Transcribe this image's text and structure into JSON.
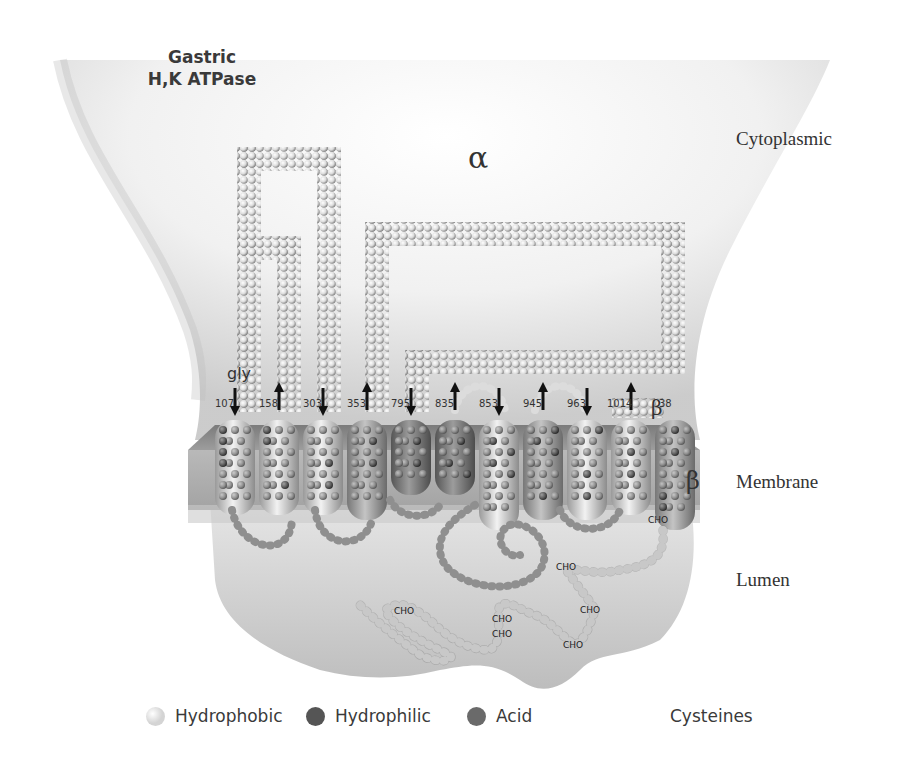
{
  "title": {
    "line1": "Gastric",
    "line2": "H,K ATPase"
  },
  "regions": {
    "cytoplasmic": "Cytoplasmic",
    "membrane": "Membrane",
    "lumen": "Lumen"
  },
  "subunits": {
    "alpha": "α",
    "beta_top": "β",
    "beta_side": "β"
  },
  "gly_label": "gly",
  "segments": [
    {
      "num": "107",
      "arrow": "down",
      "shade": "light"
    },
    {
      "num": "158",
      "arrow": "up",
      "shade": "light"
    },
    {
      "num": "303",
      "arrow": "down",
      "shade": "light"
    },
    {
      "num": "353",
      "arrow": "up",
      "shade": "medium"
    },
    {
      "num": "795",
      "arrow": "down",
      "shade": "dark"
    },
    {
      "num": "835",
      "arrow": "up",
      "shade": "dark"
    },
    {
      "num": "853",
      "arrow": "down",
      "shade": "light"
    },
    {
      "num": "945",
      "arrow": "up",
      "shade": "medium"
    },
    {
      "num": "963",
      "arrow": "down",
      "shade": "light"
    },
    {
      "num": "1014",
      "arrow": "up",
      "shade": "light"
    },
    {
      "num": "38",
      "arrow": "none",
      "shade": "medium"
    }
  ],
  "cho_labels": [
    "CHO",
    "CHO",
    "CHO",
    "CHO",
    "CHO",
    "CHO",
    "CHO"
  ],
  "legend": [
    {
      "label": "Hydrophobic",
      "color": "#d4d4d4"
    },
    {
      "label": "Hydrophilic",
      "color": "#555555"
    },
    {
      "label": "Acid",
      "color": "#6a6a6a"
    },
    {
      "label": "Cysteines",
      "color": ""
    }
  ],
  "colors": {
    "light": "#e2e2e2",
    "medium": "#a9a9a9",
    "dark": "#7a7a7a",
    "bead": "#f4f4f4",
    "bead_dark": "#9a9a9a"
  }
}
